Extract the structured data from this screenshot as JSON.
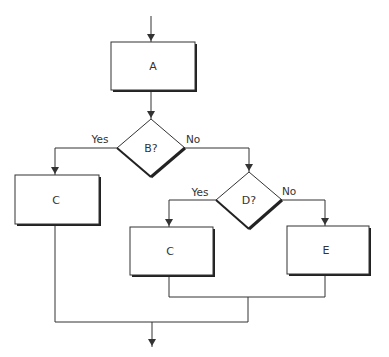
{
  "diagram": {
    "type": "flowchart",
    "nodes": [
      {
        "id": "A",
        "shape": "process",
        "label": "A"
      },
      {
        "id": "B",
        "shape": "decision",
        "label": "B?"
      },
      {
        "id": "C1",
        "shape": "process",
        "label": "C"
      },
      {
        "id": "D",
        "shape": "decision",
        "label": "D?"
      },
      {
        "id": "C2",
        "shape": "process",
        "label": "C"
      },
      {
        "id": "E",
        "shape": "process",
        "label": "E"
      }
    ],
    "edges": [
      {
        "from": "entry",
        "to": "A",
        "label": ""
      },
      {
        "from": "A",
        "to": "B",
        "label": ""
      },
      {
        "from": "B",
        "to": "C1",
        "label": "Yes"
      },
      {
        "from": "B",
        "to": "D",
        "label": "No"
      },
      {
        "from": "D",
        "to": "C2",
        "label": "Yes"
      },
      {
        "from": "D",
        "to": "E",
        "label": "No"
      },
      {
        "from": "C2",
        "to": "merge-inner",
        "label": ""
      },
      {
        "from": "E",
        "to": "merge-inner",
        "label": ""
      },
      {
        "from": "C1",
        "to": "merge-outer",
        "label": ""
      },
      {
        "from": "merge-inner",
        "to": "merge-outer",
        "label": ""
      },
      {
        "from": "merge-outer",
        "to": "exit",
        "label": ""
      }
    ],
    "labels": {
      "box_a": "A",
      "decision_b": "B?",
      "box_c_left": "C",
      "decision_d": "D?",
      "box_c_right": "C",
      "box_e": "E",
      "b_yes": "Yes",
      "b_no": "No",
      "d_yes": "Yes",
      "d_no": "No"
    },
    "colors": {
      "stroke": "#333333",
      "shadow": "#222222",
      "fill": "#ffffff",
      "text": "#333333"
    }
  }
}
